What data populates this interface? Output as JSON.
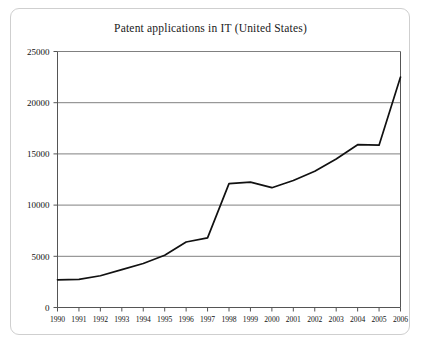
{
  "chart_data": {
    "type": "line",
    "title": "Patent applications in IT (United States)",
    "xlabel": "",
    "ylabel": "",
    "x": [
      1990,
      1991,
      1992,
      1993,
      1994,
      1995,
      1996,
      1997,
      1998,
      1999,
      2000,
      2001,
      2002,
      2003,
      2004,
      2005,
      2006
    ],
    "categories": [
      "1990",
      "1991",
      "1992",
      "1993",
      "1994",
      "1995",
      "1996",
      "1997",
      "1998",
      "1999",
      "2000",
      "2001",
      "2002",
      "2003",
      "2004",
      "2005",
      "2006"
    ],
    "values": [
      2700,
      2750,
      3100,
      3700,
      4300,
      5100,
      6400,
      6800,
      12100,
      12250,
      11700,
      12400,
      13300,
      14500,
      15900,
      15850,
      22500
    ],
    "series": [
      {
        "name": "Patent applications in IT",
        "values": [
          2700,
          2750,
          3100,
          3700,
          4300,
          5100,
          6400,
          6800,
          12100,
          12250,
          11700,
          12400,
          13300,
          14500,
          15900,
          15850,
          22500
        ]
      }
    ],
    "ylim": [
      0,
      25000
    ],
    "yticks": [
      0,
      5000,
      10000,
      15000,
      20000,
      25000
    ],
    "ytick_labels": [
      "0",
      "5000",
      "10000",
      "15000",
      "20000",
      "25000"
    ],
    "xlim": [
      1990,
      2006
    ],
    "grid": "horizontal",
    "legend": "none",
    "line_color": "#111111",
    "grid_color": "#808080",
    "axis_color": "#555555"
  }
}
